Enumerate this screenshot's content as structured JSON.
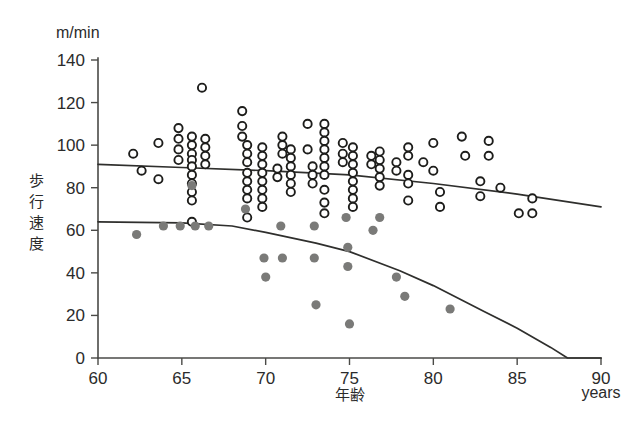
{
  "chart_data": {
    "type": "scatter",
    "title": "",
    "subtitle": "",
    "xlabel": "年齢",
    "xlabel_secondary": "years",
    "ylabel": "歩行速度",
    "y_unit": "m/min",
    "xlim": [
      60,
      90
    ],
    "ylim": [
      0,
      140
    ],
    "xticks": [
      60,
      65,
      70,
      75,
      80,
      85,
      90
    ],
    "yticks": [
      0,
      20,
      40,
      60,
      80,
      100,
      120,
      140
    ],
    "grid": false,
    "legend_position": "none",
    "colors": {
      "open_marker_stroke": "#1d1d1b",
      "open_marker_fill": "#ffffff",
      "filled_marker": "#7a7a78",
      "trend_line": "#2f2f2d",
      "axis": "#4a4a47",
      "background": "#ffffff"
    },
    "series": [
      {
        "name": "open-circles",
        "marker": "open-circle",
        "color": "#1d1d1b",
        "points": [
          [
            62.1,
            96
          ],
          [
            62.6,
            88
          ],
          [
            63.6,
            101
          ],
          [
            63.6,
            84
          ],
          [
            64.8,
            108
          ],
          [
            64.8,
            103
          ],
          [
            64.8,
            98
          ],
          [
            64.8,
            93
          ],
          [
            65.6,
            104
          ],
          [
            65.6,
            100
          ],
          [
            65.6,
            96
          ],
          [
            65.6,
            93
          ],
          [
            65.6,
            90
          ],
          [
            65.6,
            86
          ],
          [
            65.6,
            82
          ],
          [
            65.6,
            78
          ],
          [
            65.6,
            74
          ],
          [
            65.6,
            64
          ],
          [
            66.2,
            127
          ],
          [
            66.4,
            103
          ],
          [
            66.4,
            99
          ],
          [
            66.4,
            95
          ],
          [
            66.4,
            91
          ],
          [
            68.6,
            116
          ],
          [
            68.6,
            109
          ],
          [
            68.6,
            104
          ],
          [
            68.9,
            100
          ],
          [
            68.9,
            96
          ],
          [
            68.9,
            92
          ],
          [
            68.9,
            87
          ],
          [
            68.9,
            83
          ],
          [
            68.9,
            79
          ],
          [
            68.9,
            75
          ],
          [
            68.9,
            66
          ],
          [
            69.8,
            99
          ],
          [
            69.8,
            95
          ],
          [
            69.8,
            91
          ],
          [
            69.8,
            87
          ],
          [
            69.8,
            83
          ],
          [
            69.8,
            79
          ],
          [
            69.8,
            75
          ],
          [
            69.8,
            71
          ],
          [
            70.7,
            89
          ],
          [
            70.7,
            85
          ],
          [
            71.0,
            104
          ],
          [
            71.0,
            100
          ],
          [
            71.0,
            96
          ],
          [
            71.5,
            98
          ],
          [
            71.5,
            94
          ],
          [
            71.5,
            90
          ],
          [
            71.5,
            86
          ],
          [
            71.5,
            82
          ],
          [
            71.5,
            78
          ],
          [
            72.5,
            110
          ],
          [
            72.5,
            98
          ],
          [
            72.8,
            90
          ],
          [
            72.8,
            86
          ],
          [
            72.8,
            82
          ],
          [
            73.5,
            110
          ],
          [
            73.5,
            106
          ],
          [
            73.5,
            102
          ],
          [
            73.5,
            98
          ],
          [
            73.5,
            94
          ],
          [
            73.5,
            90
          ],
          [
            73.5,
            86
          ],
          [
            73.5,
            79
          ],
          [
            73.5,
            73
          ],
          [
            73.5,
            68
          ],
          [
            74.6,
            101
          ],
          [
            74.6,
            96
          ],
          [
            74.6,
            92
          ],
          [
            75.2,
            99
          ],
          [
            75.2,
            95
          ],
          [
            75.2,
            91
          ],
          [
            75.2,
            87
          ],
          [
            75.2,
            83
          ],
          [
            75.2,
            79
          ],
          [
            75.2,
            75
          ],
          [
            75.2,
            71
          ],
          [
            76.3,
            95
          ],
          [
            76.3,
            91
          ],
          [
            76.8,
            97
          ],
          [
            76.8,
            93
          ],
          [
            76.8,
            89
          ],
          [
            76.8,
            85
          ],
          [
            76.8,
            81
          ],
          [
            77.8,
            92
          ],
          [
            77.8,
            88
          ],
          [
            78.5,
            99
          ],
          [
            78.5,
            95
          ],
          [
            78.5,
            86
          ],
          [
            78.5,
            82
          ],
          [
            78.5,
            74
          ],
          [
            79.4,
            92
          ],
          [
            80.0,
            101
          ],
          [
            80.0,
            88
          ],
          [
            80.4,
            78
          ],
          [
            80.4,
            71
          ],
          [
            81.7,
            104
          ],
          [
            81.9,
            95
          ],
          [
            82.8,
            83
          ],
          [
            82.8,
            76
          ],
          [
            83.3,
            102
          ],
          [
            83.3,
            95
          ],
          [
            84.0,
            80
          ],
          [
            85.1,
            68
          ],
          [
            85.9,
            75
          ],
          [
            85.9,
            68
          ]
        ]
      },
      {
        "name": "filled-circles",
        "marker": "filled-circle",
        "color": "#7a7a78",
        "points": [
          [
            62.3,
            58
          ],
          [
            63.9,
            62
          ],
          [
            64.9,
            62
          ],
          [
            65.6,
            81
          ],
          [
            65.8,
            62
          ],
          [
            66.6,
            62
          ],
          [
            68.8,
            70
          ],
          [
            69.9,
            47
          ],
          [
            70.0,
            38
          ],
          [
            70.9,
            62
          ],
          [
            71.0,
            47
          ],
          [
            72.9,
            62
          ],
          [
            72.9,
            47
          ],
          [
            73.0,
            25
          ],
          [
            74.8,
            66
          ],
          [
            74.9,
            52
          ],
          [
            74.9,
            43
          ],
          [
            75.0,
            16
          ],
          [
            76.4,
            60
          ],
          [
            76.8,
            66
          ],
          [
            77.8,
            38
          ],
          [
            78.3,
            29
          ],
          [
            81.0,
            23
          ]
        ]
      }
    ],
    "trend_lines": [
      {
        "name": "upper-trend",
        "description": "near-linear decline for open-circle group",
        "points": [
          [
            60,
            91
          ],
          [
            65,
            89.5
          ],
          [
            70,
            88
          ],
          [
            75,
            86
          ],
          [
            80,
            82
          ],
          [
            85,
            77
          ],
          [
            90,
            71
          ]
        ]
      },
      {
        "name": "lower-trend",
        "description": "curved accelerating decline for filled-circle group, reaches zero near age 88",
        "points": [
          [
            60,
            64
          ],
          [
            65,
            63.5
          ],
          [
            68,
            62
          ],
          [
            70,
            59
          ],
          [
            73,
            54
          ],
          [
            75,
            50
          ],
          [
            78,
            41
          ],
          [
            80,
            34
          ],
          [
            83,
            22
          ],
          [
            85,
            14
          ],
          [
            87,
            5
          ],
          [
            88,
            0
          ],
          [
            90,
            0
          ]
        ]
      }
    ]
  },
  "axis": {
    "y_unit_label": "m/min",
    "y_title": "歩行速度",
    "x_title": "年齢",
    "x_unit_label": "years",
    "y_tick_labels": [
      "140",
      "120",
      "100",
      "80",
      "60",
      "40",
      "20",
      "0"
    ],
    "x_tick_labels": [
      "60",
      "65",
      "70",
      "75",
      "80",
      "85",
      "90"
    ]
  }
}
